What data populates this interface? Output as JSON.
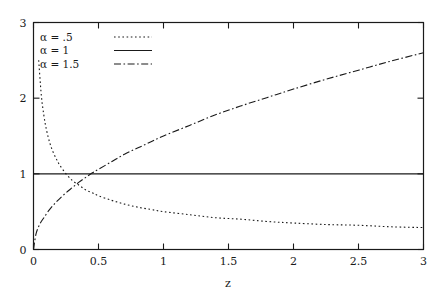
{
  "chart_data": {
    "type": "line",
    "title": "",
    "xlabel": "z",
    "ylabel": "",
    "xlim": [
      0,
      3
    ],
    "ylim": [
      0,
      3
    ],
    "grid": false,
    "legend_position": "top-left",
    "xticks": [
      0,
      0.5,
      1,
      1.5,
      2,
      2.5,
      3
    ],
    "xtick_labels": [
      "0",
      "0.5",
      "1",
      "1.5",
      "2",
      "2.5",
      "3"
    ],
    "yticks": [
      0,
      1,
      2,
      3
    ],
    "ytick_labels": [
      "0",
      "1",
      "2",
      "3"
    ],
    "series": [
      {
        "name": "alpha = .5",
        "legend_label": "α = .5",
        "style": "dotted",
        "dasharray": "1.6,2.6",
        "color": "#1a1a1a",
        "x": [
          0.04,
          0.06,
          0.08,
          0.1,
          0.125,
          0.15,
          0.175,
          0.2,
          0.25,
          0.3,
          0.35,
          0.4,
          0.45,
          0.5,
          0.6,
          0.7,
          0.8,
          0.9,
          1.0,
          1.2,
          1.4,
          1.6,
          1.8,
          2.0,
          2.25,
          2.5,
          2.75,
          3.0
        ],
        "y": [
          2.5,
          2.04,
          1.77,
          1.58,
          1.41,
          1.29,
          1.2,
          1.12,
          1.0,
          0.91,
          0.85,
          0.79,
          0.75,
          0.71,
          0.65,
          0.6,
          0.56,
          0.53,
          0.5,
          0.46,
          0.42,
          0.4,
          0.37,
          0.35,
          0.33,
          0.32,
          0.3,
          0.29
        ]
      },
      {
        "name": "alpha = 1",
        "legend_label": "α = 1",
        "style": "solid",
        "dasharray": "",
        "color": "#1a1a1a",
        "x": [
          0,
          3
        ],
        "y": [
          1,
          1
        ]
      },
      {
        "name": "alpha = 1.5",
        "legend_label": "α = 1.5",
        "style": "dash-dot",
        "dasharray": "7,2.5,1.6,2.5",
        "color": "#1a1a1a",
        "x": [
          0.0,
          0.02,
          0.05,
          0.08,
          0.12,
          0.16,
          0.2,
          0.25,
          0.3,
          0.35,
          0.4,
          0.45,
          0.5,
          0.6,
          0.7,
          0.8,
          0.9,
          1.0,
          1.2,
          1.4,
          1.6,
          1.8,
          2.0,
          2.25,
          2.5,
          2.75,
          3.0
        ],
        "y": [
          0.0,
          0.21,
          0.34,
          0.42,
          0.52,
          0.6,
          0.67,
          0.75,
          0.82,
          0.89,
          0.95,
          1.01,
          1.06,
          1.16,
          1.26,
          1.34,
          1.42,
          1.5,
          1.64,
          1.78,
          1.9,
          2.01,
          2.12,
          2.25,
          2.37,
          2.49,
          2.6
        ]
      }
    ],
    "legend_entries": [
      {
        "label": "α = .5",
        "style": "dotted"
      },
      {
        "label": "α = 1",
        "style": "solid"
      },
      {
        "label": "α = 1.5",
        "style": "dash-dot"
      }
    ]
  },
  "labels": {
    "xaxis_title": "z",
    "legend_0": "α = .5",
    "legend_1": "α = 1",
    "legend_2": "α = 1.5",
    "x_0": "0",
    "x_1": "0.5",
    "x_2": "1",
    "x_3": "1.5",
    "x_4": "2",
    "x_5": "2.5",
    "x_6": "3",
    "y_0": "0",
    "y_1": "1",
    "y_2": "2",
    "y_3": "3"
  },
  "colors": {
    "ink": "#1a1a1a",
    "background": "#ffffff"
  }
}
